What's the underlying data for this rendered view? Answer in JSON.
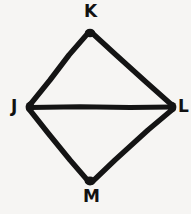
{
  "figure": {
    "shape_type": "kite-quadrilateral-with-diagonal",
    "background_color": "#f6f5f3",
    "stroke_color": "#141414",
    "label_color": "#111111",
    "stroke_width": 5,
    "canvas": {
      "width": 191,
      "height": 214
    },
    "vertices": [
      {
        "id": "K",
        "label": "K",
        "x": 90,
        "y": 31,
        "label_x": 84,
        "label_y": 3,
        "position": "top"
      },
      {
        "id": "J",
        "label": "J",
        "x": 28,
        "y": 107,
        "label_x": 11,
        "label_y": 98,
        "position": "left"
      },
      {
        "id": "L",
        "label": "L",
        "x": 174,
        "y": 107,
        "label_x": 178,
        "label_y": 98,
        "position": "right"
      },
      {
        "id": "M",
        "label": "M",
        "x": 90,
        "y": 183,
        "label_x": 83,
        "label_y": 188,
        "position": "bottom"
      }
    ],
    "edges": [
      {
        "id": "JK",
        "from": "J",
        "to": "K",
        "kind": "side"
      },
      {
        "id": "KL",
        "from": "K",
        "to": "L",
        "kind": "side"
      },
      {
        "id": "JM",
        "from": "J",
        "to": "M",
        "kind": "side"
      },
      {
        "id": "ML",
        "from": "M",
        "to": "L",
        "kind": "side"
      },
      {
        "id": "JL",
        "from": "J",
        "to": "L",
        "kind": "diagonal"
      }
    ]
  }
}
